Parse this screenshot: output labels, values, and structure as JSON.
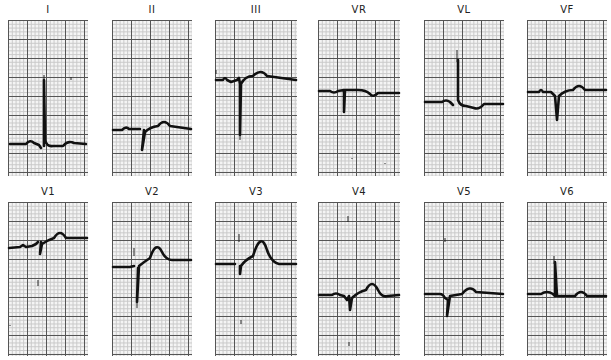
{
  "figure": {
    "type": "12-lead electrocardiogram",
    "rows": [
      [
        "I",
        "II",
        "III",
        "VR",
        "VL",
        "VF"
      ],
      [
        "V1",
        "V2",
        "V3",
        "V4",
        "V5",
        "V6"
      ]
    ]
  },
  "leads": [
    {
      "label": "I"
    },
    {
      "label": "II"
    },
    {
      "label": "III"
    },
    {
      "label": "VR"
    },
    {
      "label": "VL"
    },
    {
      "label": "VF"
    },
    {
      "label": "V1"
    },
    {
      "label": "V2"
    },
    {
      "label": "V3"
    },
    {
      "label": "V4"
    },
    {
      "label": "V5"
    },
    {
      "label": "V6"
    }
  ],
  "colors": {
    "paper": "#f4f4f4",
    "major_grid": "#555555",
    "minor_grid": "#c8c8c8",
    "trace": "#111111"
  }
}
